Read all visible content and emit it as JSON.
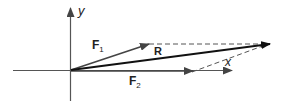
{
  "diagram": {
    "colors": {
      "axes": "#555555",
      "vectors": "#444444",
      "resultant": "#111111",
      "dashed": "#555555",
      "text": "#222222"
    },
    "axes": {
      "x_label": "x",
      "y_label": "y"
    },
    "vectors": {
      "F1": {
        "label": "F",
        "subscript": "1"
      },
      "F2": {
        "label": "F",
        "subscript": "2"
      },
      "R": {
        "label": "R"
      }
    }
  }
}
